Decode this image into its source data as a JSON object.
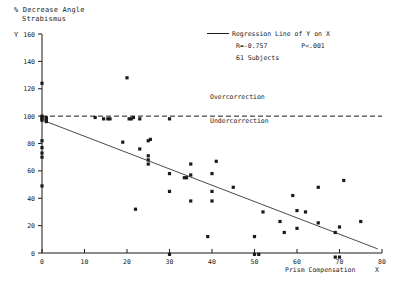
{
  "chart_data": {
    "type": "scatter",
    "title": "",
    "ylabel_lines": [
      "% Decrease Angle",
      "Strabismus"
    ],
    "ylabel": "% Decrease Angle Strabismus",
    "xlabel": "Prism Compensation",
    "x_axis_variable": "X",
    "y_axis_variable": "Y",
    "xlim": [
      0,
      80
    ],
    "ylim": [
      0,
      160
    ],
    "xticks": [
      0,
      10,
      20,
      30,
      40,
      50,
      60,
      70,
      80
    ],
    "yticks": [
      0,
      20,
      40,
      60,
      80,
      100,
      120,
      140,
      160
    ],
    "grid": false,
    "legend_position": "top-right",
    "legend": {
      "line_label": "Regression Line of Y on X",
      "r_value": "R=-0.757",
      "p_value": "P<.001",
      "subjects": "61 Subjects"
    },
    "annotations": [
      {
        "text": "Overcorrection",
        "x": 36,
        "y": 112
      },
      {
        "text": "Undercorrection",
        "x": 36,
        "y": 88
      }
    ],
    "reference_lines": [
      {
        "label": "100% line",
        "orientation": "horizontal",
        "y": 100,
        "style": "dashed"
      }
    ],
    "regression_line": {
      "label": "Regression Line of Y on X",
      "style": "solid",
      "x_start": 1,
      "y_start": 96,
      "x_end": 79,
      "y_end": 3
    },
    "series": [
      {
        "name": "Subjects",
        "marker": "square",
        "color": "#1a1a1a",
        "points": [
          [
            0,
            124
          ],
          [
            0,
            100
          ],
          [
            0,
            99
          ],
          [
            0,
            98
          ],
          [
            0,
            97
          ],
          [
            1,
            99
          ],
          [
            1,
            98
          ],
          [
            1,
            97
          ],
          [
            1,
            96
          ],
          [
            0,
            82
          ],
          [
            0,
            77
          ],
          [
            0,
            73
          ],
          [
            0,
            70
          ],
          [
            0,
            49
          ],
          [
            12.5,
            99
          ],
          [
            14.5,
            98
          ],
          [
            15.5,
            98
          ],
          [
            16,
            98
          ],
          [
            19,
            81
          ],
          [
            20,
            128
          ],
          [
            20.5,
            98
          ],
          [
            21,
            98
          ],
          [
            21.5,
            99
          ],
          [
            22,
            32
          ],
          [
            23,
            98
          ],
          [
            23,
            76
          ],
          [
            25,
            82
          ],
          [
            25.5,
            83
          ],
          [
            25,
            71
          ],
          [
            25,
            68
          ],
          [
            25,
            65
          ],
          [
            30,
            98
          ],
          [
            30,
            58
          ],
          [
            30,
            45
          ],
          [
            30,
            -1
          ],
          [
            33.5,
            55
          ],
          [
            34,
            55
          ],
          [
            35,
            65
          ],
          [
            35,
            57
          ],
          [
            35,
            38
          ],
          [
            39,
            12
          ],
          [
            40,
            58
          ],
          [
            40,
            45
          ],
          [
            40,
            38
          ],
          [
            41,
            67
          ],
          [
            45,
            48
          ],
          [
            50,
            12
          ],
          [
            50,
            -1
          ],
          [
            51,
            -1
          ],
          [
            52,
            30
          ],
          [
            56,
            23
          ],
          [
            57,
            15
          ],
          [
            59,
            42
          ],
          [
            60,
            31
          ],
          [
            60,
            18
          ],
          [
            62,
            30
          ],
          [
            65,
            22
          ],
          [
            65,
            48
          ],
          [
            69,
            -3
          ],
          [
            70,
            -3
          ],
          [
            69,
            15
          ],
          [
            70,
            19
          ],
          [
            71,
            53
          ],
          [
            75,
            23
          ]
        ]
      }
    ]
  }
}
